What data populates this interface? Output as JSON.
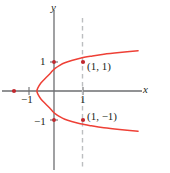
{
  "figure": {
    "width": 170,
    "height": 173,
    "background": "#ffffff"
  },
  "colors": {
    "curve": "#ee4036",
    "axis": "#6d6e71",
    "dashed_line": "#bcbec0",
    "point": "#c1272d",
    "text": "#231f20"
  },
  "axes": {
    "x_label": "x",
    "y_label": "y",
    "origin_px": [
      54,
      91
    ],
    "unit_px": 28.5,
    "xlim": [
      -2.0,
      4.0
    ],
    "ylim": [
      -2.9,
      2.9
    ]
  },
  "tick_labels": {
    "x_negative_one": "−1",
    "x_positive_one": "1",
    "y_positive_one": "1",
    "y_negative_one": "−1"
  },
  "annotations": {
    "point_upper": "(1, 1)",
    "point_lower": "(1, −1)"
  },
  "chart_data": {
    "type": "line",
    "xlabel": "x",
    "ylabel": "y",
    "xlim": [
      -2.0,
      4.0
    ],
    "ylim": [
      -2.9,
      2.9
    ],
    "grid": false,
    "legend": null,
    "series": [
      {
        "name": "curve",
        "equation": "x = y^4 - 1",
        "color": "#ee4036",
        "points": [
          [
            2.95,
            -1.41
          ],
          [
            2.3,
            -1.35
          ],
          [
            1.75,
            -1.29
          ],
          [
            1.3,
            -1.22
          ],
          [
            0.92,
            -1.15
          ],
          [
            0.62,
            -1.07
          ],
          [
            0.38,
            -0.99
          ],
          [
            0.2,
            -0.9
          ],
          [
            0.05,
            -0.8
          ],
          [
            -0.06,
            -0.7
          ],
          [
            -0.15,
            -0.6
          ],
          [
            -0.3,
            -0.45
          ],
          [
            -0.46,
            -0.28
          ],
          [
            -0.57,
            -0.1
          ],
          [
            -0.6,
            0.0
          ],
          [
            -0.57,
            0.1
          ],
          [
            -0.46,
            0.28
          ],
          [
            -0.3,
            0.45
          ],
          [
            -0.15,
            0.6
          ],
          [
            -0.06,
            0.7
          ],
          [
            0.05,
            0.8
          ],
          [
            0.2,
            0.9
          ],
          [
            0.38,
            0.99
          ],
          [
            0.62,
            1.07
          ],
          [
            0.92,
            1.15
          ],
          [
            1.3,
            1.22
          ],
          [
            1.75,
            1.29
          ],
          [
            2.3,
            1.35
          ],
          [
            2.95,
            1.41
          ]
        ]
      }
    ],
    "vertical_test_line": {
      "x": 1.0,
      "style": "dashed",
      "color": "#bcbec0"
    },
    "marked_points": [
      {
        "label": "(1, 1)",
        "x": 1.0,
        "y": 1.0
      },
      {
        "label": "(1, −1)",
        "x": 1.0,
        "y": -1.0
      },
      {
        "label": "",
        "x": -1.4,
        "y": 0.0
      }
    ],
    "x_ticks": [
      -1,
      1
    ],
    "y_ticks": [
      -1,
      1
    ]
  }
}
